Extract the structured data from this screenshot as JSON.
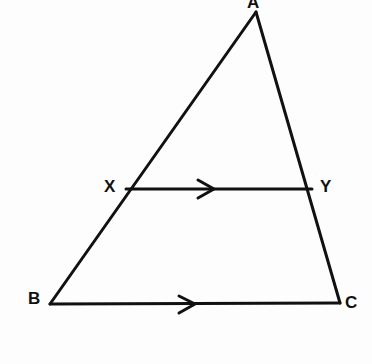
{
  "figure": {
    "kind": "geometry-diagram",
    "width": 372,
    "height": 364,
    "background_color": "#fdfdfd",
    "stroke_color": "#111111",
    "stroke_width": 3
  },
  "points": {
    "A": {
      "label": "A",
      "x": 256,
      "y": 12
    },
    "B": {
      "label": "B",
      "x": 50,
      "y": 304
    },
    "C": {
      "label": "C",
      "x": 340,
      "y": 303
    },
    "X": {
      "label": "X",
      "x": 126,
      "y": 189
    },
    "Y": {
      "label": "Y",
      "x": 312,
      "y": 189
    }
  },
  "segments": [
    {
      "name": "AB",
      "from": "A",
      "to": "B",
      "d": "M 256 12 L 50 304"
    },
    {
      "name": "AC",
      "from": "A",
      "to": "C",
      "d": "M 256 12 L 340 303"
    },
    {
      "name": "BC",
      "from": "B",
      "to": "C",
      "d": "M 50 304 L 340 303"
    },
    {
      "name": "XY",
      "from": "X",
      "to": "Y",
      "d": "M 126 189 L 312 189"
    }
  ],
  "parallel_marks": [
    {
      "name": "xy-parallel-arrow",
      "on_segment": "XY",
      "glyph": "single-chevron-right",
      "d": "M 198 180 L 214 189 L 198 198"
    },
    {
      "name": "bc-parallel-arrow",
      "on_segment": "BC",
      "glyph": "single-chevron-right",
      "d": "M 179 296 L 195 304 L 179 313"
    }
  ],
  "chart_data": {
    "type": "diagram",
    "title": "",
    "shape": "triangle",
    "vertices": [
      {
        "id": "A",
        "x": 256,
        "y": 12
      },
      {
        "id": "B",
        "x": 50,
        "y": 304
      },
      {
        "id": "C",
        "x": 340,
        "y": 303
      }
    ],
    "interior_points": [
      {
        "id": "X",
        "x": 126,
        "y": 189,
        "lies_on": "AB"
      },
      {
        "id": "Y",
        "x": 312,
        "y": 189,
        "lies_on": "AC"
      }
    ],
    "edges": [
      "AB",
      "AC",
      "BC",
      "XY"
    ],
    "annotations": [
      "XY is parallel to BC (single arrowheads on both)"
    ]
  }
}
